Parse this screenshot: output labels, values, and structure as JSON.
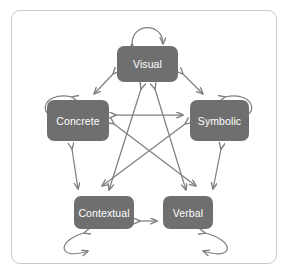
{
  "diagram": {
    "title": "",
    "background_color": "#ffffff",
    "frame_color": "#c9c9c9",
    "node_fill_color": "#6f6f6f",
    "node_text_color": "#ffffff",
    "arrow_color": "#808080",
    "nodes": [
      {
        "id": "visual",
        "label": "Visual"
      },
      {
        "id": "concrete",
        "label": "Concrete"
      },
      {
        "id": "symbolic",
        "label": "Symbolic"
      },
      {
        "id": "contextual",
        "label": "Contextual"
      },
      {
        "id": "verbal",
        "label": "Verbal"
      }
    ],
    "edges": [
      {
        "from": "visual",
        "to": "visual",
        "type": "self-loop",
        "direction": "bidirectional"
      },
      {
        "from": "concrete",
        "to": "concrete",
        "type": "self-loop",
        "direction": "bidirectional"
      },
      {
        "from": "symbolic",
        "to": "symbolic",
        "type": "self-loop",
        "direction": "bidirectional"
      },
      {
        "from": "contextual",
        "to": "contextual",
        "type": "self-loop",
        "direction": "bidirectional"
      },
      {
        "from": "verbal",
        "to": "verbal",
        "type": "self-loop",
        "direction": "bidirectional"
      },
      {
        "from": "visual",
        "to": "concrete",
        "type": "straight",
        "direction": "bidirectional"
      },
      {
        "from": "visual",
        "to": "symbolic",
        "type": "straight",
        "direction": "bidirectional"
      },
      {
        "from": "concrete",
        "to": "contextual",
        "type": "straight",
        "direction": "bidirectional"
      },
      {
        "from": "symbolic",
        "to": "verbal",
        "type": "straight",
        "direction": "bidirectional"
      },
      {
        "from": "contextual",
        "to": "verbal",
        "type": "straight",
        "direction": "bidirectional"
      },
      {
        "from": "concrete",
        "to": "symbolic",
        "type": "straight",
        "direction": "bidirectional"
      },
      {
        "from": "visual",
        "to": "contextual",
        "type": "straight",
        "direction": "bidirectional"
      },
      {
        "from": "visual",
        "to": "verbal",
        "type": "straight",
        "direction": "bidirectional"
      },
      {
        "from": "concrete",
        "to": "verbal",
        "type": "straight",
        "direction": "bidirectional"
      },
      {
        "from": "symbolic",
        "to": "contextual",
        "type": "straight",
        "direction": "bidirectional"
      }
    ]
  }
}
